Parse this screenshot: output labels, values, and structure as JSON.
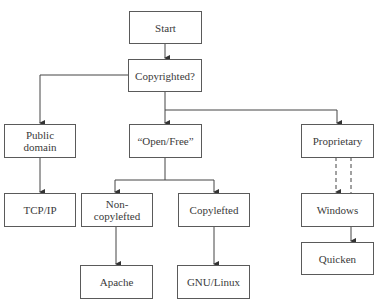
{
  "diagram": {
    "type": "flowchart",
    "colors": {
      "line": "#444444",
      "border": "#5a5a5a",
      "text": "#3a3a3a",
      "background": "#ffffff"
    },
    "nodes": {
      "start": {
        "label": "Start"
      },
      "copyrighted": {
        "label": "Copyrighted?"
      },
      "public_domain": {
        "label": "Public\ndomain"
      },
      "open_free": {
        "label": "“Open/Free”"
      },
      "proprietary": {
        "label": "Proprietary"
      },
      "tcpip": {
        "label": "TCP/IP"
      },
      "non_copylefted": {
        "label": "Non-\ncopylefted"
      },
      "copylefted": {
        "label": "Copylefted"
      },
      "windows": {
        "label": "Windows"
      },
      "quicken": {
        "label": "Quicken"
      },
      "apache": {
        "label": "Apache"
      },
      "gnu_linux": {
        "label": "GNU/Linux"
      }
    },
    "edges": [
      {
        "from": "Start",
        "to": "Copyrighted?",
        "style": "solid"
      },
      {
        "from": "Copyrighted?",
        "to": "Public domain",
        "style": "solid"
      },
      {
        "from": "Copyrighted?",
        "to": "“Open/Free”",
        "style": "solid"
      },
      {
        "from": "Copyrighted?",
        "to": "Proprietary",
        "style": "solid"
      },
      {
        "from": "Public domain",
        "to": "TCP/IP",
        "style": "solid"
      },
      {
        "from": "“Open/Free”",
        "to": "Non-copylefted",
        "style": "solid"
      },
      {
        "from": "“Open/Free”",
        "to": "Copylefted",
        "style": "solid"
      },
      {
        "from": "Non-copylefted",
        "to": "Apache",
        "style": "solid"
      },
      {
        "from": "Copylefted",
        "to": "GNU/Linux",
        "style": "solid"
      },
      {
        "from": "Proprietary",
        "to": "Windows",
        "style": "dashed"
      },
      {
        "from": "Proprietary",
        "to": "Quicken",
        "style": "dashed"
      },
      {
        "from": "Windows",
        "to": "Quicken",
        "style": "solid"
      }
    ]
  }
}
